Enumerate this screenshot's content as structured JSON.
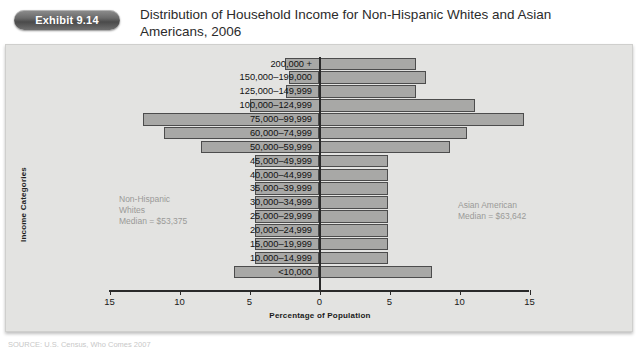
{
  "header": {
    "exhibit_badge": "Exhibit 9.14",
    "title": "Distribution of Household Income for Non-Hispanic Whites and Asian Americans, 2006"
  },
  "footer": {
    "source": "SOURCE: U.S. Census, Who Comes 2007"
  },
  "annotations": {
    "left": "Non-Hispanic\nWhites\nMedian = $53,375",
    "right": "Asian American\nMedian = $63,642"
  },
  "colors": {
    "bar_fill": "#a8a8a6",
    "bar_stroke": "#4c4c4c",
    "panel_bg": "#e3e3e1",
    "badge_bg": "#5a5a5a",
    "axis": "#2a2a2a",
    "annotation_text": "#9a9a98"
  },
  "chart_data": {
    "type": "bar",
    "orientation": "population-pyramid",
    "title": "Distribution of Household Income for Non-Hispanic Whites and Asian Americans, 2006",
    "xlabel": "Percentage of Population",
    "ylabel": "Income Categories",
    "xlim": [
      -15,
      15
    ],
    "xticks": [
      15,
      10,
      5,
      0,
      5,
      10,
      15
    ],
    "xtick_labels": [
      "15",
      "10",
      "5",
      "0",
      "5",
      "10",
      "15"
    ],
    "grid": false,
    "legend_position": "inline-annotations",
    "categories": [
      "200,000 +",
      "150,000–199,000",
      "125,000–149,999",
      "100,000–124,999",
      "75,000–99,999",
      "60,000–74,999",
      "50,000–59,999",
      "45,000–49,999",
      "40,000–44,999",
      "35,000–39,999",
      "30,000–34,999",
      "25,000–29,999",
      "20,000–24,999",
      "15,000–19,999",
      "10,000–14,999",
      "<10,000"
    ],
    "series": [
      {
        "name": "Non-Hispanic Whites",
        "side": "left",
        "median": "$53,375",
        "values": [
          2.5,
          2.2,
          2.4,
          5.0,
          12.6,
          11.1,
          8.5,
          4.6,
          4.6,
          4.6,
          4.6,
          4.6,
          4.6,
          4.6,
          4.6,
          6.1
        ]
      },
      {
        "name": "Asian American",
        "side": "right",
        "median": "$63,642",
        "values": [
          6.9,
          7.6,
          6.9,
          11.1,
          14.6,
          10.5,
          9.3,
          4.9,
          4.9,
          4.9,
          4.9,
          4.9,
          4.9,
          4.9,
          4.9,
          8.0
        ]
      }
    ]
  }
}
